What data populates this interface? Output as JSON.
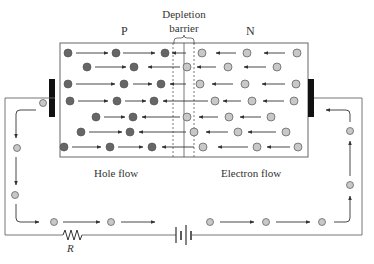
{
  "labels": {
    "p_region": "P",
    "n_region": "N",
    "depletion_line1": "Depletion",
    "depletion_line2": "barrier",
    "hole_flow": "Hole flow",
    "electron_flow": "Electron flow",
    "resistor": "R"
  },
  "colors": {
    "hole": "#666666",
    "electron": "#c8c8c8",
    "line": "#444444",
    "terminal": "#111111"
  },
  "holes": [
    [
      68,
      53
    ],
    [
      116,
      53
    ],
    [
      165,
      53
    ],
    [
      87,
      67
    ],
    [
      134,
      67
    ],
    [
      68,
      84
    ],
    [
      124,
      84
    ],
    [
      161,
      84
    ],
    [
      70,
      101
    ],
    [
      117,
      101
    ],
    [
      154,
      101
    ],
    [
      96,
      117
    ],
    [
      133,
      117
    ],
    [
      81,
      132
    ],
    [
      130,
      132
    ],
    [
      64,
      147
    ],
    [
      110,
      147
    ],
    [
      152,
      147
    ]
  ],
  "electrons": [
    [
      202,
      53
    ],
    [
      247,
      53
    ],
    [
      297,
      53
    ],
    [
      187,
      67
    ],
    [
      228,
      67
    ],
    [
      277,
      67
    ],
    [
      200,
      84
    ],
    [
      245,
      84
    ],
    [
      296,
      84
    ],
    [
      215,
      101
    ],
    [
      252,
      101
    ],
    [
      294,
      101
    ],
    [
      187,
      117
    ],
    [
      229,
      117
    ],
    [
      271,
      117
    ],
    [
      194,
      132
    ],
    [
      238,
      132
    ],
    [
      286,
      132
    ],
    [
      203,
      147
    ],
    [
      257,
      147
    ],
    [
      298,
      147
    ]
  ],
  "circuit_electrons": [
    [
      43,
      103
    ],
    [
      17,
      148
    ],
    [
      15,
      195
    ],
    [
      54,
      222
    ],
    [
      111,
      222
    ],
    [
      210,
      222
    ],
    [
      266,
      222
    ],
    [
      322,
      222
    ],
    [
      350,
      185
    ],
    [
      350,
      131
    ]
  ]
}
